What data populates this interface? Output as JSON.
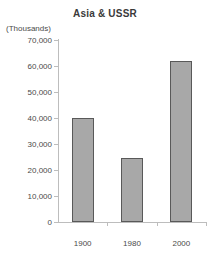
{
  "chart_data": {
    "type": "bar",
    "title": "Asia & USSR",
    "units_caption": "(Thousands)",
    "categories": [
      "1900",
      "1980",
      "2000"
    ],
    "values": [
      40000,
      24500,
      62000
    ],
    "xlabel": "",
    "ylabel": "",
    "ylim": [
      0,
      70000
    ],
    "yticks": [
      70000,
      60000,
      50000,
      40000,
      30000,
      20000,
      10000,
      0
    ],
    "ytick_labels": [
      "70,000",
      "60,000",
      "50,000",
      "40,000",
      "30,000",
      "20,000",
      "10,000",
      "0"
    ],
    "grid": false,
    "legend": false,
    "colors": {
      "bar_fill": "#a8a8a8",
      "bar_border": "#595959",
      "axis": "#bdbdbd",
      "text": "#4a4a4a",
      "title": "#3a3a3a",
      "background": "#ffffff"
    }
  }
}
